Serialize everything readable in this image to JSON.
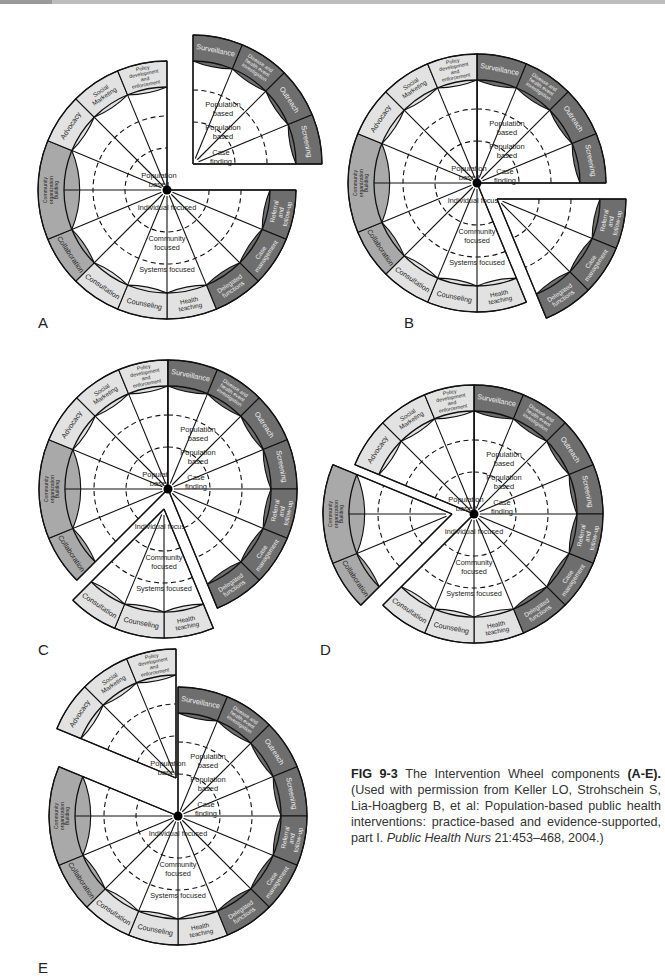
{
  "figure": {
    "number": "FIG 9-3",
    "caption_title": "The Intervention Wheel components",
    "caption_range": "(A-E).",
    "caption_body": "(Used with permission from Keller LO, Strohschein S, Lia-Hoagberg B, et al: Population-based public health interventions: practice-based and evidence-supported, part I.",
    "caption_journal": "Public Health Nurs",
    "caption_citation": "21:453–468, 2004.)"
  },
  "panels": [
    {
      "label": "A"
    },
    {
      "label": "B"
    },
    {
      "label": "C"
    },
    {
      "label": "D"
    },
    {
      "label": "E"
    }
  ],
  "wheel": {
    "colors": {
      "dark": "#6e6e6e",
      "mid": "#a9a9a9",
      "light": "#e2e2e2",
      "line": "#111111"
    },
    "segments": [
      {
        "label": "Surveillance",
        "tone": "dark"
      },
      {
        "label": "Disease and health event investigation",
        "tone": "dark"
      },
      {
        "label": "Outreach",
        "tone": "dark"
      },
      {
        "label": "Screening",
        "tone": "dark"
      },
      {
        "label": "Referral and follow-up",
        "tone": "dark"
      },
      {
        "label": "Case management",
        "tone": "dark"
      },
      {
        "label": "Delegated functions",
        "tone": "dark"
      },
      {
        "label": "Health teaching",
        "tone": "light"
      },
      {
        "label": "Counseling",
        "tone": "light"
      },
      {
        "label": "Consultation",
        "tone": "light"
      },
      {
        "label": "Collaboration",
        "tone": "mid"
      },
      {
        "label": "Community organization Building",
        "tone": "mid"
      },
      {
        "label": "Advocacy",
        "tone": "light"
      },
      {
        "label": "Social Marketing",
        "tone": "light"
      },
      {
        "label": "Policy development and enforcement",
        "tone": "light"
      }
    ],
    "levels": {
      "population_based": "Population based",
      "case_finding": "Case finding",
      "individual_focused": "Individual focused",
      "community_focused": "Community focused",
      "systems_focused": "Systems focused"
    }
  }
}
